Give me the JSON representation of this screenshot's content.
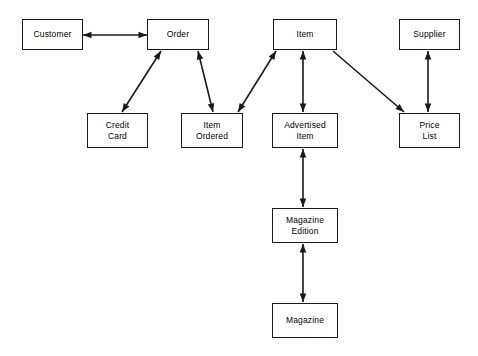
{
  "diagram": {
    "type": "entity-relationship",
    "background_color": "#ffffff",
    "line_color": "#1a1a1a",
    "text_color": "#000000",
    "nodes": [
      {
        "id": "customer",
        "label": "Customer",
        "x": 22,
        "y": 19,
        "w": 61,
        "h": 31
      },
      {
        "id": "order",
        "label": "Order",
        "x": 147,
        "y": 19,
        "w": 62,
        "h": 31
      },
      {
        "id": "item",
        "label": "Item",
        "x": 273,
        "y": 19,
        "w": 64,
        "h": 31
      },
      {
        "id": "supplier",
        "label": "Supplier",
        "x": 399,
        "y": 19,
        "w": 61,
        "h": 31
      },
      {
        "id": "credit_card",
        "label": "Credit\nCard",
        "x": 87,
        "y": 113,
        "w": 61,
        "h": 35
      },
      {
        "id": "item_ordered",
        "label": "Item\nOrdered",
        "x": 181,
        "y": 113,
        "w": 62,
        "h": 35
      },
      {
        "id": "advertised_item",
        "label": "Advertised\nItem",
        "x": 272,
        "y": 113,
        "w": 66,
        "h": 35
      },
      {
        "id": "price_list",
        "label": "Price\nList",
        "x": 399,
        "y": 113,
        "w": 61,
        "h": 35
      },
      {
        "id": "magazine_edition",
        "label": "Magazine\nEdition",
        "x": 272,
        "y": 208,
        "w": 66,
        "h": 35
      },
      {
        "id": "magazine",
        "label": "Magazine",
        "x": 272,
        "y": 303,
        "w": 66,
        "h": 35
      }
    ],
    "edges": [
      {
        "id": "customer-order",
        "from": "Customer",
        "to": "Order",
        "x1": 83,
        "y1": 35,
        "x2": 147,
        "y2": 35,
        "arrow_start": true,
        "arrow_end": true
      },
      {
        "id": "order-credit-card",
        "from": "Order",
        "to": "Credit Card",
        "x1": 161,
        "y1": 51,
        "x2": 122,
        "y2": 112,
        "arrow_start": true,
        "arrow_end": true
      },
      {
        "id": "order-item-ordered",
        "from": "Order",
        "to": "Item Ordered",
        "x1": 198,
        "y1": 51,
        "x2": 213,
        "y2": 112,
        "arrow_start": true,
        "arrow_end": true
      },
      {
        "id": "item-item-ordered",
        "from": "Item",
        "to": "Item Ordered",
        "x1": 276,
        "y1": 51,
        "x2": 238,
        "y2": 112,
        "arrow_start": true,
        "arrow_end": true
      },
      {
        "id": "item-advertised-item",
        "from": "Item",
        "to": "Advertised Item",
        "x1": 303,
        "y1": 51,
        "x2": 303,
        "y2": 112,
        "arrow_start": true,
        "arrow_end": true
      },
      {
        "id": "item-price-list",
        "from": "Item",
        "to": "Price List",
        "x1": 333,
        "y1": 51,
        "x2": 404,
        "y2": 112,
        "arrow_start": false,
        "arrow_end": true
      },
      {
        "id": "supplier-price-list",
        "from": "Supplier",
        "to": "Price List",
        "x1": 428,
        "y1": 51,
        "x2": 428,
        "y2": 112,
        "arrow_start": true,
        "arrow_end": true
      },
      {
        "id": "advertised-item-magazine-edition",
        "from": "Advertised Item",
        "to": "Magazine Edition",
        "x1": 303,
        "y1": 149,
        "x2": 303,
        "y2": 207,
        "arrow_start": true,
        "arrow_end": true
      },
      {
        "id": "magazine-edition-magazine",
        "from": "Magazine Edition",
        "to": "Magazine",
        "x1": 303,
        "y1": 244,
        "x2": 303,
        "y2": 302,
        "arrow_start": true,
        "arrow_end": true
      }
    ]
  }
}
